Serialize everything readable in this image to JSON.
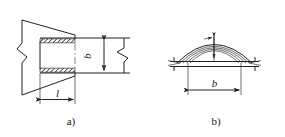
{
  "drawing": {
    "title_visible": false,
    "background_color": "#ffffff",
    "line_color": "#222222",
    "figures": [
      {
        "id": "a",
        "caption": "a)",
        "view": "plan-view-of-welded-lap-joint",
        "dimensions": [
          {
            "name": "weld-length",
            "label": "l",
            "orientation": "horizontal"
          },
          {
            "name": "plate-width",
            "label": "b",
            "orientation": "vertical"
          }
        ],
        "features": [
          "trapezoidal-gusset-plate",
          "upper-weld-seam-hatched",
          "lower-weld-seam-hatched",
          "centerline",
          "left-break-line",
          "right-break-line"
        ]
      },
      {
        "id": "b",
        "caption": "b)",
        "view": "section-view-of-curved-weld-bead",
        "dimensions": [
          {
            "name": "plate-width",
            "label": "b",
            "orientation": "horizontal"
          }
        ],
        "features": [
          "domed-weld-bead-arcs",
          "base-plate",
          "apex-thickness-arrow",
          "left-break-line",
          "right-break-line"
        ]
      }
    ]
  }
}
